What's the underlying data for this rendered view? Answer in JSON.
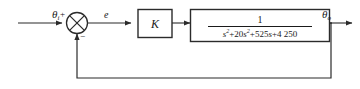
{
  "diagram": {
    "background": "#ffffff",
    "line_color": "#2b2b2b",
    "text_color": "#1a1a1a",
    "input_signal": {
      "symbol": "θ",
      "subscript": "i",
      "name": "theta-i"
    },
    "error_signal": {
      "symbol": "e",
      "name": "error"
    },
    "output_signal": {
      "symbol": "θ",
      "subscript": "o",
      "name": "theta-o"
    },
    "summing_junction": {
      "name": "summing-junction",
      "positive_sign": "+",
      "negative_sign": "−",
      "style": "circle-with-cross"
    },
    "gain_block": {
      "name": "gain-block",
      "label": "K"
    },
    "plant_block": {
      "name": "plant-transfer-function-block",
      "numerator": "1",
      "denominator_plain": "s²+20s²+525s+4 250",
      "denominator_parts": [
        {
          "base": "s",
          "exp": "2"
        },
        {
          "text": "+20"
        },
        {
          "base": "s",
          "exp": "2"
        },
        {
          "text": "+525"
        },
        {
          "base": "s",
          "exp": ""
        },
        {
          "text": "+4 250"
        }
      ]
    },
    "feedback_path": {
      "name": "feedback-path",
      "description": "unity feedback from output to summing junction"
    }
  }
}
